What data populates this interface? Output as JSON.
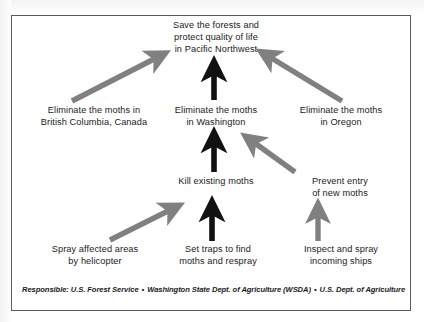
{
  "diagram": {
    "frame": {
      "border_color": "#5a5a5a"
    },
    "colors": {
      "arrow_black": "#111111",
      "arrow_gray": "#808080",
      "text": "#1a1a1a"
    },
    "nodes": {
      "goal": "Save the forests and\nprotect quality of life\nin Pacific Northwest",
      "british_columbia": "Eliminate the moths in\nBritish Columbia, Canada",
      "washington": "Eliminate the moths\nin Washington",
      "oregon": "Eliminate the moths\nin Oregon",
      "kill_moths": "Kill existing moths",
      "prevent_entry": "Prevent entry\nof new moths",
      "spray_helicopter": "Spray affected areas\nby helicopter",
      "set_traps": "Set traps to find\nmoths and respray",
      "inspect_ships": "Inspect and spray\nincoming ships"
    },
    "arrows": [
      {
        "name": "bc-to-goal",
        "style": "gray-diagonal",
        "from": "british_columbia",
        "to": "goal"
      },
      {
        "name": "washington-to-goal",
        "style": "black-vertical",
        "from": "washington",
        "to": "goal"
      },
      {
        "name": "oregon-to-goal",
        "style": "gray-diagonal",
        "from": "oregon",
        "to": "goal"
      },
      {
        "name": "kill-to-washington",
        "style": "black-vertical",
        "from": "kill_moths",
        "to": "washington"
      },
      {
        "name": "prevent-to-washington",
        "style": "gray-diagonal",
        "from": "prevent_entry",
        "to": "washington"
      },
      {
        "name": "spray-to-kill",
        "style": "gray-diagonal",
        "from": "spray_helicopter",
        "to": "kill_moths"
      },
      {
        "name": "traps-to-kill",
        "style": "black-vertical",
        "from": "set_traps",
        "to": "kill_moths"
      },
      {
        "name": "inspect-to-prevent",
        "style": "gray-vertical",
        "from": "inspect_ships",
        "to": "prevent_entry"
      }
    ],
    "footer": {
      "responsible_label": "Responsible: U.S. Forest Service",
      "separator": "•",
      "org_two": "Washington State Dept. of Agriculture (WSDA)",
      "org_three": "U.S. Dept. of Agriculture"
    }
  }
}
